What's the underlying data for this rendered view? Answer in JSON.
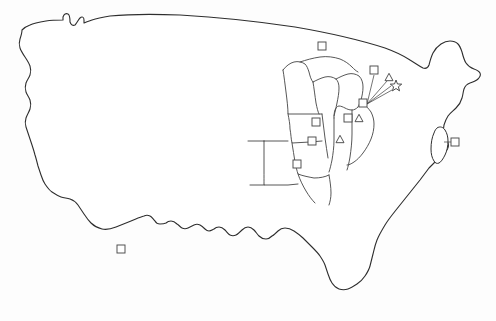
{
  "figure": {
    "title": "United States outline map with study-site symbols",
    "background_color": "#fdfdfd",
    "outline_color": "#2e2e2e",
    "state_boundary_color": "#444444",
    "symbol_stroke_color": "#4a4a4a",
    "symbol_fill_color": "#ffffff",
    "leader_line_color": "#3a3a3a",
    "width": 496,
    "height": 321
  },
  "legend_symbols": [
    {
      "name": "square",
      "glyph": "square-marker",
      "count": 10
    },
    {
      "name": "triangle",
      "glyph": "triangle-marker",
      "count": 3
    },
    {
      "name": "star",
      "glyph": "star-marker",
      "count": 1
    }
  ],
  "markers": [
    {
      "id": "m1",
      "type": "square",
      "x": 322,
      "y": 46,
      "size": 8,
      "region": "upper-midwest"
    },
    {
      "id": "m2",
      "type": "square",
      "x": 374,
      "y": 70,
      "size": 8,
      "region": "great-lakes-callout"
    },
    {
      "id": "m3",
      "type": "triangle",
      "x": 389,
      "y": 77,
      "size": 8,
      "region": "great-lakes-callout"
    },
    {
      "id": "m4",
      "type": "star",
      "x": 396,
      "y": 86,
      "size": 9,
      "region": "great-lakes-callout"
    },
    {
      "id": "m5",
      "type": "square",
      "x": 363,
      "y": 103,
      "size": 8,
      "region": "lake-erie"
    },
    {
      "id": "m6",
      "type": "square",
      "x": 348,
      "y": 118,
      "size": 8,
      "region": "indiana-ohio"
    },
    {
      "id": "m7",
      "type": "triangle",
      "x": 359,
      "y": 118,
      "size": 8,
      "region": "indiana-ohio"
    },
    {
      "id": "m8",
      "type": "square",
      "x": 316,
      "y": 122,
      "size": 8,
      "region": "iowa-illinois"
    },
    {
      "id": "m9",
      "type": "triangle",
      "x": 340,
      "y": 139,
      "size": 8,
      "region": "indiana"
    },
    {
      "id": "m10",
      "type": "square",
      "x": 312,
      "y": 141,
      "size": 8,
      "region": "missouri-illinois"
    },
    {
      "id": "m11",
      "type": "square",
      "x": 297,
      "y": 164,
      "size": 8,
      "region": "kansas-missouri"
    },
    {
      "id": "m12",
      "type": "square",
      "x": 455,
      "y": 142,
      "size": 8,
      "region": "northeast-coast-callout"
    },
    {
      "id": "m13",
      "type": "square",
      "x": 121,
      "y": 249,
      "size": 8,
      "region": "southwest"
    }
  ],
  "leader_lines": [
    {
      "from_x": 367,
      "from_y": 104,
      "to_x": 374,
      "to_y": 74,
      "target": "m2"
    },
    {
      "from_x": 367,
      "from_y": 104,
      "to_x": 387,
      "to_y": 80,
      "target": "m3"
    },
    {
      "from_x": 367,
      "from_y": 104,
      "to_x": 392,
      "to_y": 86,
      "target": "m4"
    },
    {
      "from_x": 367,
      "from_y": 104,
      "to_x": 393,
      "to_y": 90,
      "target": "m4b"
    },
    {
      "from_x": 446,
      "from_y": 142,
      "to_x": 451,
      "to_y": 142,
      "target": "m12"
    }
  ]
}
